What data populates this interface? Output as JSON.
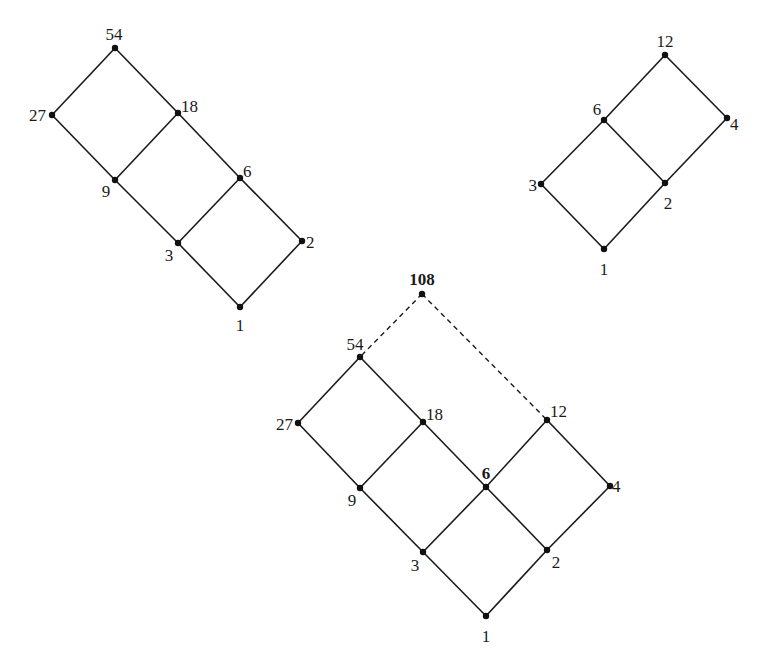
{
  "figure": {
    "background": "#ffffff",
    "line_color": "#1a1a1a",
    "node_color": "#111111"
  },
  "diagrams": [
    {
      "id": "divisors-54",
      "description": "Hasse diagram of divisors of 54",
      "nodes": [
        {
          "label": "54",
          "x": 115,
          "y": 48,
          "lx": 114,
          "ly": 40,
          "anchor": "middle",
          "bold": false
        },
        {
          "label": "27",
          "x": 52,
          "y": 115,
          "lx": 46,
          "ly": 121,
          "anchor": "end",
          "bold": false
        },
        {
          "label": "18",
          "x": 178,
          "y": 113,
          "lx": 181,
          "ly": 112,
          "anchor": "start",
          "bold": false
        },
        {
          "label": "9",
          "x": 115,
          "y": 180,
          "lx": 106,
          "ly": 197,
          "anchor": "middle",
          "bold": false
        },
        {
          "label": "6",
          "x": 240,
          "y": 178,
          "lx": 243,
          "ly": 177,
          "anchor": "start",
          "bold": false
        },
        {
          "label": "3",
          "x": 178,
          "y": 243,
          "lx": 169,
          "ly": 261,
          "anchor": "middle",
          "bold": false
        },
        {
          "label": "2",
          "x": 302,
          "y": 241,
          "lx": 306,
          "ly": 248,
          "anchor": "start",
          "bold": false
        },
        {
          "label": "1",
          "x": 240,
          "y": 307,
          "lx": 240,
          "ly": 331,
          "anchor": "middle",
          "bold": false
        }
      ],
      "edges": [
        [
          "54",
          "27",
          "solid"
        ],
        [
          "54",
          "18",
          "solid"
        ],
        [
          "27",
          "9",
          "solid"
        ],
        [
          "18",
          "9",
          "solid"
        ],
        [
          "18",
          "6",
          "solid"
        ],
        [
          "9",
          "3",
          "solid"
        ],
        [
          "6",
          "3",
          "solid"
        ],
        [
          "6",
          "2",
          "solid"
        ],
        [
          "3",
          "1",
          "solid"
        ],
        [
          "2",
          "1",
          "solid"
        ]
      ]
    },
    {
      "id": "divisors-12",
      "description": "Hasse diagram of divisors of 12",
      "nodes": [
        {
          "label": "12",
          "x": 665,
          "y": 55,
          "lx": 665,
          "ly": 47,
          "anchor": "middle",
          "bold": false
        },
        {
          "label": "6",
          "x": 604,
          "y": 120,
          "lx": 597,
          "ly": 115,
          "anchor": "middle",
          "bold": false
        },
        {
          "label": "4",
          "x": 727,
          "y": 118,
          "lx": 730,
          "ly": 130,
          "anchor": "start",
          "bold": false
        },
        {
          "label": "3",
          "x": 541,
          "y": 184,
          "lx": 537,
          "ly": 191,
          "anchor": "end",
          "bold": false
        },
        {
          "label": "2",
          "x": 665,
          "y": 183,
          "lx": 668,
          "ly": 209,
          "anchor": "middle",
          "bold": false
        },
        {
          "label": "1",
          "x": 604,
          "y": 249,
          "lx": 604,
          "ly": 275,
          "anchor": "middle",
          "bold": false
        }
      ],
      "edges": [
        [
          "12",
          "6",
          "solid"
        ],
        [
          "12",
          "4",
          "solid"
        ],
        [
          "6",
          "3",
          "solid"
        ],
        [
          "6",
          "2",
          "solid"
        ],
        [
          "4",
          "2",
          "solid"
        ],
        [
          "3",
          "1",
          "solid"
        ],
        [
          "2",
          "1",
          "solid"
        ]
      ]
    },
    {
      "id": "divisors-108",
      "description": "Combined Hasse diagram with 108 joining 54 and 12",
      "nodes": [
        {
          "label": "108",
          "x": 422,
          "y": 294,
          "lx": 422,
          "ly": 285,
          "anchor": "middle",
          "bold": true
        },
        {
          "label": "54",
          "x": 360,
          "y": 357,
          "lx": 355,
          "ly": 350,
          "anchor": "middle",
          "bold": false
        },
        {
          "label": "27",
          "x": 298,
          "y": 423,
          "lx": 293,
          "ly": 430,
          "anchor": "end",
          "bold": false
        },
        {
          "label": "18",
          "x": 423,
          "y": 422,
          "lx": 426,
          "ly": 420,
          "anchor": "start",
          "bold": false
        },
        {
          "label": "12",
          "x": 547,
          "y": 420,
          "lx": 550,
          "ly": 417,
          "anchor": "start",
          "bold": false
        },
        {
          "label": "9",
          "x": 360,
          "y": 488,
          "lx": 352,
          "ly": 506,
          "anchor": "middle",
          "bold": false
        },
        {
          "label": "6",
          "x": 486,
          "y": 487,
          "lx": 486,
          "ly": 479,
          "anchor": "middle",
          "bold": true
        },
        {
          "label": "4",
          "x": 610,
          "y": 486,
          "lx": 612,
          "ly": 492,
          "anchor": "start",
          "bold": false
        },
        {
          "label": "3",
          "x": 423,
          "y": 552,
          "lx": 415,
          "ly": 571,
          "anchor": "middle",
          "bold": false
        },
        {
          "label": "2",
          "x": 547,
          "y": 550,
          "lx": 556,
          "ly": 568,
          "anchor": "middle",
          "bold": false
        },
        {
          "label": "1",
          "x": 486,
          "y": 616,
          "lx": 486,
          "ly": 642,
          "anchor": "middle",
          "bold": false
        }
      ],
      "edges": [
        [
          "108",
          "54",
          "dashed"
        ],
        [
          "108",
          "12",
          "dashed"
        ],
        [
          "54",
          "27",
          "solid"
        ],
        [
          "54",
          "18",
          "solid"
        ],
        [
          "27",
          "9",
          "solid"
        ],
        [
          "18",
          "9",
          "solid"
        ],
        [
          "18",
          "6",
          "solid"
        ],
        [
          "12",
          "6",
          "solid"
        ],
        [
          "12",
          "4",
          "solid"
        ],
        [
          "9",
          "3",
          "solid"
        ],
        [
          "6",
          "3",
          "solid"
        ],
        [
          "6",
          "2",
          "solid"
        ],
        [
          "4",
          "2",
          "solid"
        ],
        [
          "3",
          "1",
          "solid"
        ],
        [
          "2",
          "1",
          "solid"
        ]
      ]
    }
  ]
}
